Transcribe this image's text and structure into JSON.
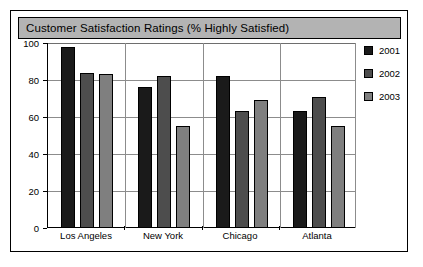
{
  "chart_data": {
    "type": "bar",
    "title": "Customer Satisfaction Ratings (% Highly Satisfied)",
    "xlabel": "",
    "ylabel": "",
    "ylim": [
      0,
      100
    ],
    "yticks": [
      0,
      20,
      40,
      60,
      80,
      100
    ],
    "ytick_labels": [
      "0",
      "20",
      "40",
      "60",
      "80",
      "100"
    ],
    "categories": [
      "Los Angeles",
      "New York",
      "Chicago",
      "Atlanta"
    ],
    "series": [
      {
        "name": "2001",
        "color": "#1a1a1a",
        "values": [
          98,
          76,
          82,
          63
        ]
      },
      {
        "name": "2002",
        "color": "#4d4d4d",
        "values": [
          84,
          82,
          63,
          71
        ]
      },
      {
        "name": "2003",
        "color": "#7f7f7f",
        "values": [
          83,
          55,
          69,
          55
        ]
      }
    ],
    "grid": true,
    "grid_axis": "y",
    "legend_position": "right",
    "bar_border_color": "#000000",
    "plot_background": "#ffffff",
    "title_background": "#b3b3b3",
    "frame_color": "#000000"
  }
}
